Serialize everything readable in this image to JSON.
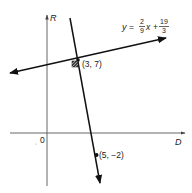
{
  "diagram": {
    "axes": {
      "vertical_label": "R",
      "horizontal_label": "D",
      "origin_label": "0"
    },
    "equation": {
      "lhs": "y",
      "equals": "=",
      "coef_num": "2",
      "coef_den": "9",
      "var": "x",
      "plus": "+",
      "const_num": "19",
      "const_den": "3"
    },
    "points": [
      {
        "label": "(3, 7)"
      },
      {
        "label": "(5, −2)"
      }
    ],
    "colors": {
      "line": "#111111",
      "axis": "#555555",
      "text": "#222222"
    }
  }
}
